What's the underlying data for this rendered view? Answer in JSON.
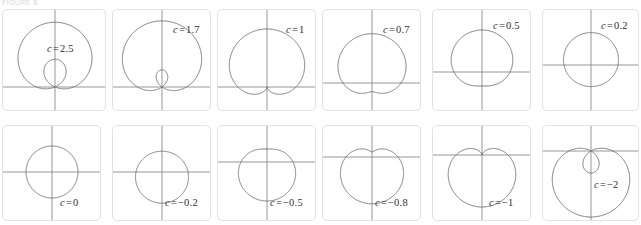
{
  "figure": {
    "caption_remnant": "FIGURE 8",
    "panel_border_color": "#e2e2e6",
    "axis_color": "#8a8a90",
    "curve_color": "#6f6f76",
    "label_color": "#2f2f33",
    "background": "#ffffff",
    "rows": 2,
    "columns": 6
  },
  "panels": [
    {
      "id": "panel-c-2-5",
      "label_var": "c",
      "label_eq": "=",
      "label_value": "2.5",
      "c": 2.5,
      "x": 2,
      "y": 9,
      "w": 104,
      "h": 102,
      "cx": 52,
      "cy": 77,
      "scale": 18.5,
      "label_x": 44,
      "label_y": 33,
      "label_align": "left",
      "axis_x_frac": 0.5,
      "axis_y_frac": 0.667
    },
    {
      "id": "panel-c-1-7",
      "label_var": "c",
      "label_eq": "=",
      "label_value": "1.7",
      "c": 1.7,
      "x": 112,
      "y": 9,
      "w": 99,
      "h": 102,
      "cx": 49,
      "cy": 77,
      "scale": 24.5,
      "label_x": 60,
      "label_y": 14,
      "label_align": "left",
      "axis_x_frac": 0.5,
      "axis_y_frac": 0.755
    },
    {
      "id": "panel-c-1",
      "label_var": "c",
      "label_eq": "=",
      "label_value": "1",
      "c": 1,
      "x": 217,
      "y": 9,
      "w": 99,
      "h": 102,
      "cx": 49,
      "cy": 77,
      "scale": 29,
      "label_x": 68,
      "label_y": 14,
      "label_align": "left",
      "axis_x_frac": 0.5,
      "axis_y_frac": 0.755
    },
    {
      "id": "panel-c-0-7",
      "label_var": "c",
      "label_eq": "=",
      "label_value": "0.7",
      "c": 0.7,
      "x": 322,
      "y": 9,
      "w": 99,
      "h": 102,
      "cx": 49,
      "cy": 73,
      "scale": 29,
      "label_x": 60,
      "label_y": 14,
      "label_align": "left",
      "axis_x_frac": 0.5,
      "axis_y_frac": 0.716
    },
    {
      "id": "panel-c-0-5",
      "label_var": "c",
      "label_eq": "=",
      "label_value": "0.5",
      "c": 0.5,
      "x": 432,
      "y": 9,
      "w": 99,
      "h": 102,
      "cx": 49,
      "cy": 62,
      "scale": 28,
      "label_x": 60,
      "label_y": 10,
      "label_align": "left",
      "axis_x_frac": 0.5,
      "axis_y_frac": 0.608
    },
    {
      "id": "panel-c-0-2",
      "label_var": "c",
      "label_eq": "=",
      "label_value": "0.2",
      "c": 0.2,
      "x": 542,
      "y": 9,
      "w": 97,
      "h": 102,
      "cx": 48,
      "cy": 55,
      "scale": 27,
      "label_x": 58,
      "label_y": 10,
      "label_align": "left",
      "axis_x_frac": 0.5,
      "axis_y_frac": 0.539
    },
    {
      "id": "panel-c-0",
      "label_var": "c",
      "label_eq": "=",
      "label_value": "0",
      "c": 0,
      "x": 2,
      "y": 125,
      "w": 99,
      "h": 96,
      "cx": 49,
      "cy": 46,
      "scale": 26,
      "label_x": 57,
      "label_y": 71,
      "label_align": "left",
      "axis_x_frac": 0.5,
      "axis_y_frac": 0.479
    },
    {
      "id": "panel-c-minus-0-2",
      "label_var": "c",
      "label_eq": "=",
      "label_value": "−0.2",
      "c": -0.2,
      "x": 112,
      "y": 125,
      "w": 99,
      "h": 96,
      "cx": 49,
      "cy": 46,
      "scale": 26,
      "label_x": 52,
      "label_y": 71,
      "label_align": "left",
      "axis_x_frac": 0.5,
      "axis_y_frac": 0.479
    },
    {
      "id": "panel-c-minus-0-5",
      "label_var": "c",
      "label_eq": "=",
      "label_value": "−0.5",
      "c": -0.5,
      "x": 217,
      "y": 125,
      "w": 99,
      "h": 96,
      "cx": 49,
      "cy": 36,
      "scale": 26,
      "label_x": 52,
      "label_y": 71,
      "label_align": "left",
      "axis_x_frac": 0.5,
      "axis_y_frac": 0.375
    },
    {
      "id": "panel-c-minus-0-8",
      "label_var": "c",
      "label_eq": "=",
      "label_value": "−0.8",
      "c": -0.8,
      "x": 322,
      "y": 125,
      "w": 99,
      "h": 96,
      "cx": 49,
      "cy": 31,
      "scale": 26,
      "label_x": 52,
      "label_y": 71,
      "label_align": "left",
      "axis_x_frac": 0.5,
      "axis_y_frac": 0.323
    },
    {
      "id": "panel-c-minus-1",
      "label_var": "c",
      "label_eq": "=",
      "label_value": "−1",
      "c": -1,
      "x": 432,
      "y": 125,
      "w": 99,
      "h": 96,
      "cx": 49,
      "cy": 29,
      "scale": 26,
      "label_x": 56,
      "label_y": 71,
      "label_align": "left",
      "axis_x_frac": 0.5,
      "axis_y_frac": 0.302
    },
    {
      "id": "panel-c-minus-2",
      "label_var": "c",
      "label_eq": "=",
      "label_value": "−2",
      "c": -2,
      "x": 542,
      "y": 125,
      "w": 97,
      "h": 96,
      "cx": 48,
      "cy": 25,
      "scale": 22,
      "label_x": 51,
      "label_y": 53,
      "label_align": "left",
      "axis_x_frac": 0.5,
      "axis_y_frac": 0.26
    }
  ],
  "chart_data": {
    "type": "line",
    "equation": "r = 1 + c sin(θ)",
    "xlabel": "",
    "ylabel": "",
    "grid": false,
    "legend": "none",
    "panel_labels": [
      "c = 2.5",
      "c = 1.7",
      "c = 1",
      "c = 0.7",
      "c = 0.5",
      "c = 0.2",
      "c = 0",
      "c = −0.2",
      "c = −0.5",
      "c = −0.8",
      "c = −1",
      "c = −2"
    ],
    "series": [
      {
        "name": "c = 2.5",
        "c": 2.5,
        "shape": "limacon with inner loop"
      },
      {
        "name": "c = 1.7",
        "c": 1.7,
        "shape": "limacon with inner loop"
      },
      {
        "name": "c = 1",
        "c": 1,
        "shape": "cardioid"
      },
      {
        "name": "c = 0.7",
        "c": 0.7,
        "shape": "dimpled limacon"
      },
      {
        "name": "c = 0.5",
        "c": 0.5,
        "shape": "convex limacon"
      },
      {
        "name": "c = 0.2",
        "c": 0.2,
        "shape": "convex limacon"
      },
      {
        "name": "c = 0",
        "c": 0,
        "shape": "circle"
      },
      {
        "name": "c = −0.2",
        "c": -0.2,
        "shape": "convex limacon"
      },
      {
        "name": "c = −0.5",
        "c": -0.5,
        "shape": "convex limacon"
      },
      {
        "name": "c = −0.8",
        "c": -0.8,
        "shape": "dimpled limacon"
      },
      {
        "name": "c = −1",
        "c": -1,
        "shape": "cardioid"
      },
      {
        "name": "c = −2",
        "c": -2,
        "shape": "limacon with inner loop"
      }
    ]
  }
}
